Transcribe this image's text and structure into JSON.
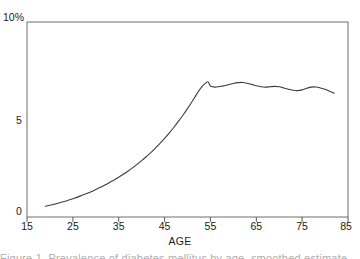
{
  "chart_data": {
    "type": "line",
    "title": "",
    "xlabel": "AGE",
    "ylabel": "",
    "xlim": [
      15,
      85
    ],
    "ylim": [
      0,
      10
    ],
    "grid": false,
    "legend": null,
    "y_tick_labels": [
      "0",
      "5",
      "10%"
    ],
    "y_ticks": [
      0,
      5,
      10
    ],
    "x_ticks": [
      15,
      25,
      35,
      45,
      55,
      65,
      75,
      85
    ],
    "x_tick_labels": [
      "15",
      "25",
      "35",
      "45",
      "55",
      "65",
      "75",
      "85"
    ],
    "units": "percent",
    "series": [
      {
        "name": "prevalence",
        "color": "#3d3d3d",
        "x": [
          19,
          20,
          21,
          22,
          23,
          24,
          25,
          26,
          27,
          28,
          29,
          30,
          31,
          32,
          33,
          34,
          35,
          36,
          37,
          38,
          39,
          40,
          41,
          42,
          43,
          44,
          45,
          46,
          47,
          48,
          49,
          50,
          51,
          52,
          53,
          54,
          54.5,
          55,
          56,
          57,
          58,
          59,
          60,
          61,
          62,
          63,
          64,
          65,
          66,
          67,
          68,
          69,
          70,
          71,
          72,
          73,
          74,
          75,
          76,
          77,
          78,
          79,
          80,
          81,
          82
        ],
        "y": [
          0.55,
          0.6,
          0.66,
          0.72,
          0.79,
          0.86,
          0.94,
          1.02,
          1.11,
          1.2,
          1.3,
          1.41,
          1.52,
          1.64,
          1.77,
          1.9,
          2.04,
          2.19,
          2.35,
          2.52,
          2.7,
          2.89,
          3.09,
          3.3,
          3.53,
          3.77,
          4.03,
          4.3,
          4.59,
          4.9,
          5.22,
          5.56,
          5.92,
          6.3,
          6.65,
          6.88,
          6.93,
          6.72,
          6.66,
          6.69,
          6.73,
          6.79,
          6.85,
          6.89,
          6.9,
          6.86,
          6.8,
          6.73,
          6.68,
          6.66,
          6.68,
          6.7,
          6.68,
          6.62,
          6.55,
          6.5,
          6.48,
          6.52,
          6.6,
          6.66,
          6.67,
          6.62,
          6.55,
          6.45,
          6.35
        ]
      }
    ]
  },
  "figure": {
    "y_axis": {
      "label_top": "10%",
      "label_mid": "5",
      "label_bottom": "0"
    },
    "x_axis": {
      "title": "AGE",
      "ticks": [
        "15",
        "25",
        "35",
        "45",
        "55",
        "65",
        "75",
        "85"
      ]
    },
    "caption_sliver": "Figure 1. Prevalence of diabetes mellitus by age, smoothed estimate"
  }
}
